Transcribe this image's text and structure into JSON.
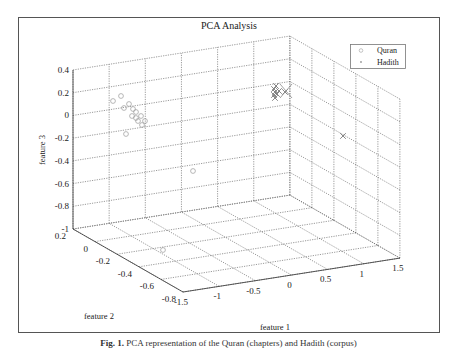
{
  "chart_data": {
    "type": "scatter",
    "subtype": "3d-scatter",
    "title": "PCA Analysis",
    "xlabel": "feature 1",
    "ylabel": "feature 2",
    "zlabel": "feature 3",
    "xlim": [
      -1.5,
      1.5
    ],
    "ylim": [
      -0.8,
      0.2
    ],
    "zlim": [
      -1,
      0.4
    ],
    "xticks": [
      "-1.5",
      "-1",
      "-0.5",
      "0",
      "0.5",
      "1",
      "1.5"
    ],
    "yticks": [
      "0.2",
      "0",
      "-0.2",
      "-0.4",
      "-0.6",
      "-0.8"
    ],
    "zticks": [
      "0.4",
      "0.2",
      "0",
      "-0.2",
      "-0.4",
      "-0.6",
      "-0.8",
      "-1"
    ],
    "grid": true,
    "legend_position": "upper right",
    "legend": [
      "Quran",
      "Hadith"
    ],
    "series": [
      {
        "name": "Quran",
        "marker": "o",
        "color": "#9a9a9a",
        "points_screen": [
          [
            113,
            101
          ],
          [
            121,
            96
          ],
          [
            124,
            108
          ],
          [
            129,
            104
          ],
          [
            133,
            109
          ],
          [
            136,
            112
          ],
          [
            132,
            116
          ],
          [
            136,
            118
          ],
          [
            141,
            116
          ],
          [
            138,
            121
          ],
          [
            145,
            121
          ],
          [
            142,
            125
          ],
          [
            126,
            134
          ],
          [
            193,
            171
          ],
          [
            163,
            250
          ]
        ]
      },
      {
        "name": "Hadith",
        "marker": "x",
        "color": "#7a7a7a",
        "points_screen": [
          [
            274,
            89
          ],
          [
            275,
            92
          ],
          [
            274,
            95
          ],
          [
            275,
            98
          ],
          [
            276,
            86
          ],
          [
            277,
            94
          ],
          [
            279,
            91
          ],
          [
            285,
            92
          ],
          [
            343,
            136
          ]
        ]
      }
    ]
  },
  "figure": {
    "title": "PCA Analysis",
    "legend": {
      "items": [
        {
          "label": "Quran",
          "marker": "○"
        },
        {
          "label": "Hadith",
          "marker": "*"
        }
      ]
    },
    "axis_labels": {
      "x": "feature 1",
      "y": "feature 2",
      "z": "feature 3"
    }
  },
  "caption": {
    "label": "Fig. 1.",
    "text": "PCA representation of the Quran (chapters) and Hadith (corpus)"
  }
}
